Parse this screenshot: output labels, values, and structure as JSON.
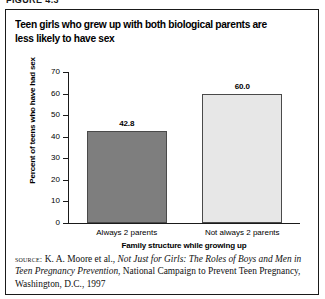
{
  "figure": {
    "number_label": "FIGURE 4.3"
  },
  "title": "Teen girls who grew up with both biological parents are less likely to have sex",
  "source": {
    "kicker": "source:",
    "lead": " K. A. Moore et al., ",
    "publication": "Not Just for Girls: The Roles of Boys and Men in Teen Pregnancy Prevention",
    "tail": ", National Campaign to Prevent Teen Pregnancy, Washington, D.C., 1997"
  },
  "chart_data": {
    "type": "bar",
    "title": "Teen girls who grew up with both biological parents are less likely to have sex",
    "categories": [
      "Always 2 parents",
      "Not always 2 parents"
    ],
    "values": [
      42.8,
      60.0
    ],
    "value_labels": [
      "42.8",
      "60.0"
    ],
    "xlabel": "Family structure while growing up",
    "ylabel": "Percent of teens who have had sex",
    "ylim": [
      0,
      70
    ],
    "ytick_labels": [
      "70",
      "60",
      "50",
      "40",
      "30",
      "20",
      "10",
      "0"
    ],
    "ytick_values": [
      70,
      60,
      50,
      40,
      30,
      20,
      10,
      0
    ],
    "grid": false,
    "legend": "none",
    "bar_colors": [
      "#7e7e7e",
      "#e7e7e7"
    ],
    "bar_edge_color": "#4a4a4a"
  }
}
